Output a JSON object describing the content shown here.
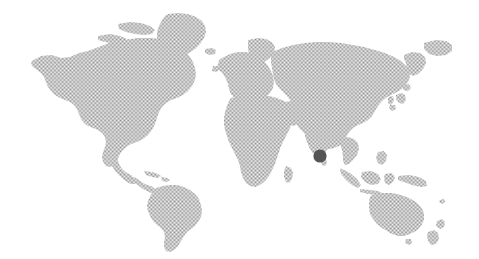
{
  "graphic": {
    "type": "world-locator-map",
    "title": "World map with location marker",
    "width": 479,
    "height": 259,
    "background_color": "#ffffff",
    "land_color": "#9a9a9a",
    "land_render_style": "halftone-dots",
    "halftone": {
      "dot_color": "#8c8c8c",
      "dot_radius": 0.42,
      "cell_size": 1.35,
      "apparent_gray": "#b0b0b0"
    },
    "labels": [],
    "legend": [],
    "graticule": false,
    "projection": "robinson-like"
  },
  "markers": [
    {
      "name": "location-marker",
      "region_label": "South India / Sri Lanka",
      "shape": "circle",
      "color": "#545457",
      "cx": 320,
      "cy": 156,
      "r": 6.6,
      "approx_lat": 8.0,
      "approx_lon": 80.0
    }
  ],
  "continents": [
    {
      "name": "north-america"
    },
    {
      "name": "greenland"
    },
    {
      "name": "south-america"
    },
    {
      "name": "europe"
    },
    {
      "name": "africa"
    },
    {
      "name": "asia"
    },
    {
      "name": "southeast-asia-islands"
    },
    {
      "name": "australia"
    },
    {
      "name": "new-zealand"
    },
    {
      "name": "japan"
    },
    {
      "name": "british-isles"
    },
    {
      "name": "madagascar"
    },
    {
      "name": "iceland"
    },
    {
      "name": "caribbean"
    },
    {
      "name": "philippines"
    }
  ]
}
